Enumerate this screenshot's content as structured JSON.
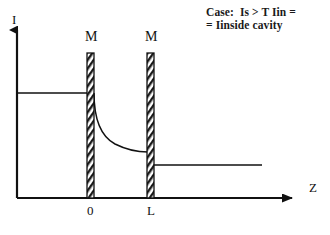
{
  "figure": {
    "type": "physics-schematic"
  },
  "caption": {
    "line1": "Case:  Is > T Iin =",
    "line2": "= Iinside cavity"
  },
  "axes": {
    "y_label": "I",
    "x_label": "Z",
    "y_axis_x": 17,
    "baseline_y": 198,
    "y_axis_top": 26,
    "x_axis_end": 300
  },
  "ticks": [
    {
      "name": "origin",
      "label": "0",
      "x": 90
    },
    {
      "name": "cavity-length",
      "label": "L",
      "x": 150
    }
  ],
  "mirrors": [
    {
      "name": "mirror-left",
      "label": "M",
      "x": 87,
      "width": 7,
      "top": 53,
      "bottom": 198
    },
    {
      "name": "mirror-right",
      "label": "M",
      "x": 147,
      "width": 7,
      "top": 53,
      "bottom": 198
    }
  ],
  "curves": {
    "incident": {
      "name": "incident-intensity-line",
      "level_y": 93,
      "x_start": 17,
      "x_end": 87
    },
    "cavity_decay": {
      "name": "cavity-decay-curve",
      "x_start": 94,
      "y_start": 93,
      "x_end": 147,
      "y_end": 152,
      "path": "M 94 93 C 94 118, 100 136, 115 144 C 127 150, 138 152, 147 152"
    },
    "transmitted": {
      "name": "transmitted-intensity-line",
      "level_y": 165,
      "x_start": 154,
      "x_end": 262
    }
  },
  "style": {
    "stroke": "#111111",
    "hatch_color": "#1a1a1a",
    "background": "#ffffff"
  }
}
